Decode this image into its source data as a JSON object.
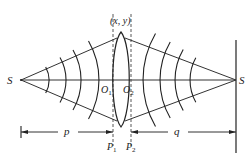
{
  "diagram": {
    "labels": {
      "source": "S",
      "image": "S'",
      "lens_point": "(x, y)",
      "vertex_left": "O",
      "vertex_left_sub": "1",
      "vertex_right": "O",
      "vertex_right_sub": "2",
      "plane_left": "P",
      "plane_left_sub": "1",
      "plane_right": "P",
      "plane_right_sub": "2",
      "object_distance": "p",
      "image_distance": "q"
    },
    "elements": [
      "optical axis",
      "biconvex lens",
      "diverging spherical wavefronts from S (4 arcs)",
      "converging spherical wavefronts toward S' (4 arcs)",
      "marginal rays from S through lens edge to S'",
      "dashed principal planes P1 and P2",
      "image screen at S'",
      "dimension arrows p and q"
    ]
  }
}
